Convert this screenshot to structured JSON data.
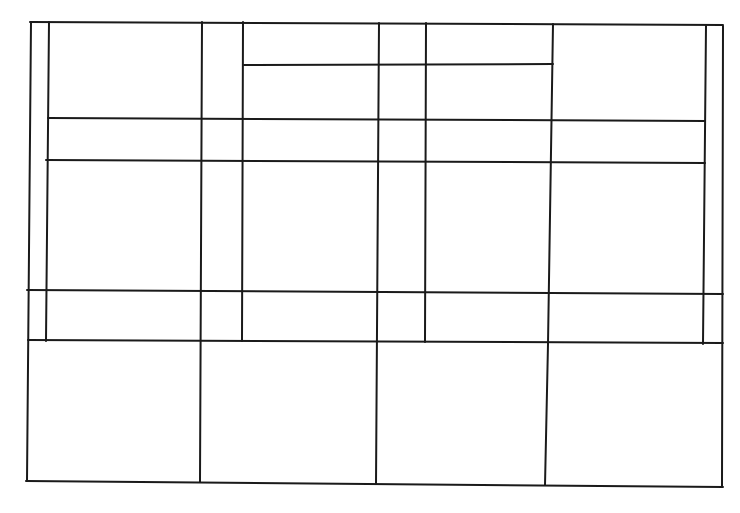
{
  "sketch": {
    "description": "hand-drawn grid of rectangles",
    "stroke_color": "#1a1a1a",
    "background": "#ffffff",
    "lines": [
      {
        "id": "top-border",
        "x1": 30,
        "y1": 22,
        "x2": 723,
        "y2": 25
      },
      {
        "id": "bottom-border",
        "x1": 26,
        "y1": 481,
        "x2": 723,
        "y2": 487
      },
      {
        "id": "left-outer-border",
        "x1": 31,
        "y1": 22,
        "x2": 27,
        "y2": 481
      },
      {
        "id": "left-inner-border",
        "x1": 49,
        "y1": 22,
        "x2": 46,
        "y2": 341
      },
      {
        "id": "right-outer-border",
        "x1": 723,
        "y1": 26,
        "x2": 722,
        "y2": 487
      },
      {
        "id": "right-inner-border",
        "x1": 706,
        "y1": 26,
        "x2": 703,
        "y2": 344
      },
      {
        "id": "vertical-202",
        "x1": 202,
        "y1": 22,
        "x2": 200,
        "y2": 482
      },
      {
        "id": "vertical-243",
        "x1": 243,
        "y1": 22,
        "x2": 242,
        "y2": 341
      },
      {
        "id": "vertical-378",
        "x1": 379,
        "y1": 23,
        "x2": 376,
        "y2": 484
      },
      {
        "id": "vertical-426",
        "x1": 426,
        "y1": 23,
        "x2": 425,
        "y2": 342
      },
      {
        "id": "vertical-553",
        "x1": 553,
        "y1": 24,
        "x2": 548,
        "y2": 344
      },
      {
        "id": "vertical-545-lower",
        "x1": 548,
        "y1": 344,
        "x2": 545,
        "y2": 485
      },
      {
        "id": "horizontal-65",
        "x1": 244,
        "y1": 65,
        "x2": 553,
        "y2": 64
      },
      {
        "id": "horizontal-119",
        "x1": 48,
        "y1": 118,
        "x2": 705,
        "y2": 121
      },
      {
        "id": "horizontal-161",
        "x1": 46,
        "y1": 160,
        "x2": 705,
        "y2": 163
      },
      {
        "id": "horizontal-291",
        "x1": 27,
        "y1": 290,
        "x2": 723,
        "y2": 294
      },
      {
        "id": "horizontal-342",
        "x1": 28,
        "y1": 340,
        "x2": 723,
        "y2": 343
      }
    ]
  }
}
